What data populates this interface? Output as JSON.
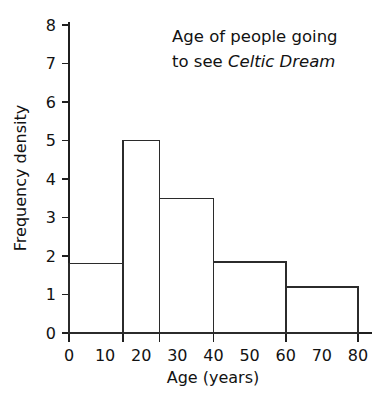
{
  "chart_data": {
    "type": "bar",
    "title_lines": [
      {
        "plain": "Age of people going",
        "italic": ""
      },
      {
        "plain": "to see ",
        "italic": "Celtic Dream"
      }
    ],
    "xlabel": "Age (years)",
    "ylabel": "Frequency density",
    "xlim": [
      0,
      80
    ],
    "ylim": [
      0,
      8
    ],
    "grid": false,
    "legend": false,
    "x_tick_labels": [
      "0",
      "10",
      "20",
      "30",
      "40",
      "50",
      "60",
      "70",
      "80"
    ],
    "x_tick_values": [
      0,
      10,
      20,
      30,
      40,
      50,
      60,
      70,
      80
    ],
    "x_tick_marks": [
      0,
      15,
      25,
      40,
      60,
      80
    ],
    "y_tick_labels": [
      "0",
      "1",
      "2",
      "3",
      "4",
      "5",
      "6",
      "7",
      "8"
    ],
    "y_tick_values": [
      0,
      1,
      2,
      3,
      4,
      5,
      6,
      7,
      8
    ],
    "bin_edges": [
      0,
      15,
      25,
      40,
      60,
      80
    ],
    "categories": [
      "0-15",
      "15-25",
      "25-40",
      "40-60",
      "60-80"
    ],
    "values": [
      1.8,
      5.0,
      3.5,
      1.85,
      1.2
    ],
    "bars": [
      {
        "label": "0-15",
        "x0": 0,
        "x1": 15,
        "density": 1.8
      },
      {
        "label": "15-25",
        "x0": 15,
        "x1": 25,
        "density": 5.0
      },
      {
        "label": "25-40",
        "x0": 25,
        "x1": 40,
        "density": 3.5
      },
      {
        "label": "40-60",
        "x0": 40,
        "x1": 60,
        "density": 1.85
      },
      {
        "label": "60-80",
        "x0": 60,
        "x1": 80,
        "density": 1.2
      }
    ],
    "colors": {
      "bar_fill": "#ffffff",
      "bar_stroke": "#2b2b2b",
      "axis": "#1f1f1f",
      "text": "#121212",
      "background": "#ffffff"
    }
  }
}
